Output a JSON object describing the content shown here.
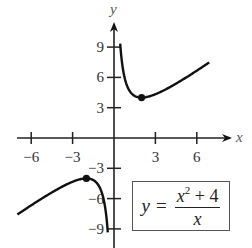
{
  "chart_data": {
    "type": "line",
    "title": "",
    "equation": {
      "lhs": "y",
      "eq": "=",
      "num_var": "x",
      "num_exp": "2",
      "num_rest": "+ 4",
      "den": "x"
    },
    "xlabel": "x",
    "ylabel": "y",
    "xlim": [
      -8,
      8.5
    ],
    "ylim": [
      -10,
      12
    ],
    "x_ticks": [
      -6,
      -3,
      3,
      6
    ],
    "x_tick_labels": [
      "−6",
      "−3",
      "3",
      "6"
    ],
    "y_ticks": [
      9,
      6,
      3,
      -3,
      -6,
      -9
    ],
    "y_tick_labels": [
      "9",
      "6",
      "3",
      "−3",
      "−6",
      "−9"
    ],
    "grid": false,
    "series": [
      {
        "name": "right branch",
        "function": "(x^2+4)/x",
        "x_range": [
          0.45,
          6.9
        ]
      },
      {
        "name": "left branch",
        "function": "(x^2+4)/x",
        "x_range": [
          -7,
          -0.45
        ]
      }
    ],
    "marked_points": [
      {
        "x": 2,
        "y": 4,
        "label": "local minimum"
      },
      {
        "x": -2,
        "y": -4,
        "label": "local maximum"
      }
    ]
  }
}
